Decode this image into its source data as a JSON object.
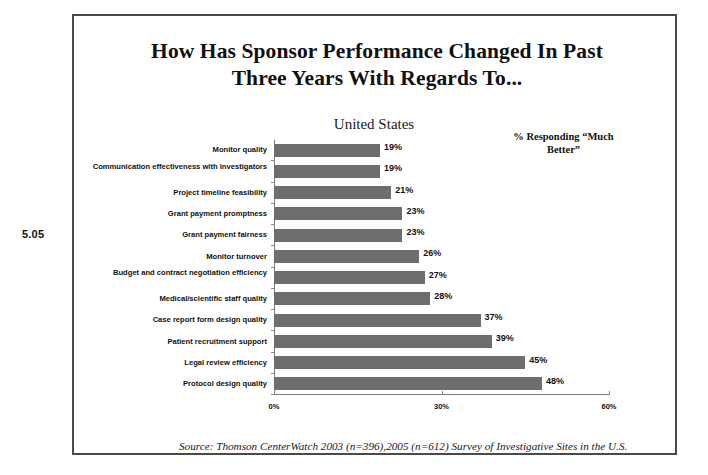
{
  "figure_number": "5.05",
  "title_line_1": "How Has Sponsor Performance Changed In Past",
  "title_line_2": "Three Years With Regards To...",
  "subtitle": "United States",
  "legend_note_line_1": "% Responding “Much",
  "legend_note_line_2": "Better”",
  "source_note": "Source:  Thomson CenterWatch 2003 (n=396),2005 (n=612) Survey of Investigative Sites in the U.S.",
  "colors": {
    "bar": "#6e6e6e",
    "frame": "#4a4a4a",
    "axis": "#7a7a7a",
    "text": "#111111"
  },
  "chart_data": {
    "type": "bar",
    "orientation": "horizontal",
    "title": "How Has Sponsor Performance Changed In Past Three Years With Regards To...",
    "subtitle": "United States",
    "xlabel": "",
    "ylabel": "",
    "xlim": [
      0,
      60
    ],
    "xticks": [
      0,
      30,
      60
    ],
    "xtick_labels": [
      "0%",
      "30%",
      "60%"
    ],
    "grid": false,
    "legend_position": "top-right",
    "legend_entries": [
      "% Responding “Much Better”"
    ],
    "value_suffix": "%",
    "categories": [
      "Monitor quality",
      "Communication effectiveness with investigators",
      "Project timeline feasibility",
      "Grant payment promptness",
      "Grant payment fairness",
      "Monitor turnover",
      "Budget and contract negotiation efficiency",
      "Medical/scientific staff quality",
      "Case report form design quality",
      "Patient recruitment support",
      "Legal review efficiency",
      "Protocol design quality"
    ],
    "values": [
      19,
      19,
      21,
      23,
      23,
      26,
      27,
      28,
      37,
      39,
      45,
      48
    ],
    "value_labels": [
      "19%",
      "19%",
      "21%",
      "23%",
      "23%",
      "26%",
      "27%",
      "28%",
      "37%",
      "39%",
      "45%",
      "48%"
    ]
  }
}
